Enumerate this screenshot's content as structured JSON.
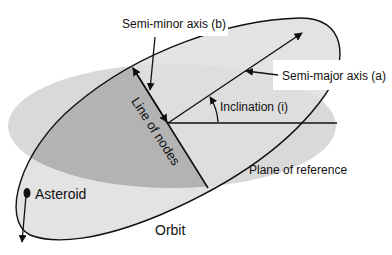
{
  "diagram": {
    "title": "",
    "labels": {
      "semi_minor_axis": "Semi-minor axis (b)",
      "semi_major_axis": "Semi-major axis (a)",
      "inclination": "Inclination (i)",
      "line_of_nodes": "Line of nodes",
      "plane_of_reference": "Plane of reference",
      "asteroid": "Asteroid",
      "orbit": "Orbit"
    },
    "colors": {
      "background": "#ffffff",
      "plane_fill": "#d9d9d9",
      "orbit_fill": "#d4d4d4",
      "overlap_fill": "#b3b3b3",
      "stroke": "#111111"
    },
    "elements": [
      {
        "id": "plane-of-reference",
        "type": "ellipse"
      },
      {
        "id": "orbit",
        "type": "ellipse"
      },
      {
        "id": "line-of-nodes",
        "type": "line"
      },
      {
        "id": "semi-major-axis",
        "type": "arrow"
      },
      {
        "id": "semi-minor-axis",
        "type": "double-arrow"
      },
      {
        "id": "reference-direction",
        "type": "line"
      },
      {
        "id": "inclination-angle",
        "type": "arc-arrow"
      },
      {
        "id": "asteroid",
        "type": "point",
        "with_velocity_arrow": true
      }
    ]
  }
}
